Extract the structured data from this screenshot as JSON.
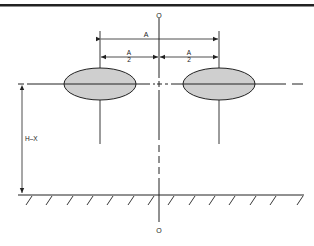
{
  "diagram": {
    "type": "engineering dimension drawing",
    "labels": {
      "axis_top": "O",
      "axis_bottom": "O",
      "overall_spacing": "A",
      "half_spacing_left_num": "A",
      "half_spacing_left_den": "2",
      "half_spacing_right_num": "A",
      "half_spacing_right_den": "2",
      "height": "H–X"
    },
    "colors": {
      "line": "#222222",
      "ellipse_fill": "#cfcfcf",
      "background": "#ffffff"
    },
    "elements": {
      "ellipses": 2,
      "ground_hatch_count": 14
    }
  }
}
